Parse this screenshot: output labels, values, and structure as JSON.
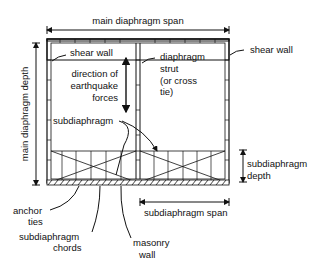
{
  "labels": {
    "main_span": "main diaphragm span",
    "main_depth": "main diaphragm depth",
    "shear_wall_left": "shear wall",
    "shear_wall_right": "shear wall",
    "strut_1": "diaphragm",
    "strut_2": "strut",
    "strut_3": "(or cross",
    "strut_4": "tie)",
    "dir_1": "direction of",
    "dir_2": "earthquake",
    "dir_3": "forces",
    "subdiaphragm": "subdiaphragm",
    "sub_depth_1": "subdiaphragm",
    "sub_depth_2": "depth",
    "sub_span": "subdiaphragm span",
    "anchor_1": "anchor",
    "anchor_2": "ties",
    "chords_1": "subdiaphragm",
    "chords_2": "chords",
    "masonry_1": "masonry",
    "masonry_2": "wall"
  }
}
